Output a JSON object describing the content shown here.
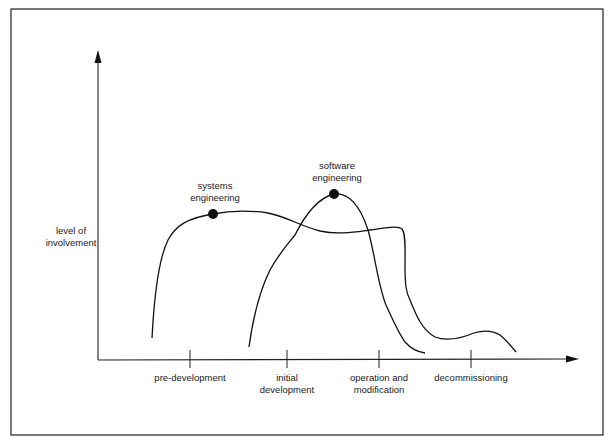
{
  "diagram": {
    "y_axis_label": [
      "level of",
      "involvement"
    ],
    "x_axis_phases": [
      {
        "lines": [
          "pre-development"
        ]
      },
      {
        "lines": [
          "initial",
          "development"
        ]
      },
      {
        "lines": [
          "operation and",
          "modification"
        ]
      },
      {
        "lines": [
          "decommissioning"
        ]
      }
    ],
    "curves": [
      {
        "name": "systems engineering",
        "label_lines": [
          "systems",
          "engineering"
        ],
        "marker": "filled-circle",
        "description": "rises steeply at start of pre-development, plateaus high through initial development, dips slightly, stays until operation and modification, drops sharply, then low bump during decommissioning"
      },
      {
        "name": "software engineering",
        "label_lines": [
          "software",
          "engineering"
        ],
        "marker": "filled-circle",
        "description": "rises from late pre-development, peaks during initial development (highest point), falls steeply through operation and modification to near zero"
      }
    ],
    "colors": {
      "ink": "#1a1a1a",
      "background": "#ffffff"
    }
  }
}
